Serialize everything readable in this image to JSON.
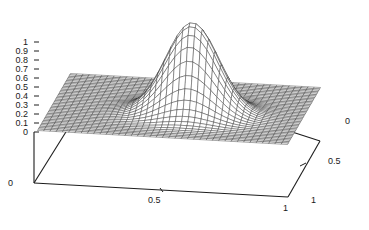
{
  "figure": {
    "kind": "surface-plot",
    "background_color": "#ffffff",
    "line_color": "#2b2b2b",
    "axis_color": "#1d1d1d"
  },
  "chart_data": {
    "type": "surface",
    "title": "",
    "xlabel": "",
    "ylabel": "",
    "zlabel": "",
    "grid": false,
    "legend": "none",
    "projection": "3d-mesh-wireframe",
    "xlim": [
      0,
      1
    ],
    "ylim": [
      0,
      1
    ],
    "zlim": [
      0,
      1
    ],
    "x_ticks": [
      0,
      0.5,
      1
    ],
    "x_tick_labels": [
      "0",
      "0.5",
      "1"
    ],
    "y_ticks": [
      0,
      0.5,
      1
    ],
    "y_tick_labels": [
      "0",
      "0.5",
      "1"
    ],
    "z_ticks": [
      0,
      0.1,
      0.2,
      0.3,
      0.4,
      0.5,
      0.6,
      0.7,
      0.8,
      0.9,
      1
    ],
    "z_tick_labels": [
      "0",
      "0.1",
      "0.2",
      "0.3",
      "0.4",
      "0.5",
      "0.6",
      "0.7",
      "0.8",
      "0.9",
      "1"
    ],
    "surface": {
      "description": "single gaussian peak centred on a flat baseline plane",
      "peak_value": 1.0,
      "peak_x": 0.56,
      "peak_y": 0.45,
      "baseline_value": 0.0,
      "sigma_x": 0.105,
      "sigma_y": 0.105,
      "grid_nx": 41,
      "grid_ny": 41
    }
  },
  "z_axis": {
    "labels": [
      "1",
      "0.9",
      "0.8",
      "0.7",
      "0.6",
      "0.5",
      "0.4",
      "0.3",
      "0.2",
      "0.1",
      "0"
    ]
  },
  "x_axis": {
    "labels": [
      "0",
      "0.5",
      "1"
    ]
  },
  "y_axis": {
    "labels": [
      "0",
      "0.5",
      "1"
    ]
  }
}
